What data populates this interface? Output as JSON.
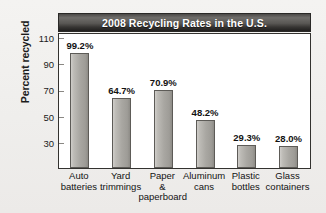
{
  "chart_data": {
    "type": "bar",
    "title": "2008 Recycling Rates in the U.S.",
    "xlabel": "",
    "ylabel": "Percent recycled",
    "categories": [
      "Auto\nbatteries",
      "Yard\ntrimmings",
      "Paper\n&\npaperboard",
      "Aluminum\ncans",
      "Plastic\nbottles",
      "Glass\ncontainers"
    ],
    "values": [
      99.2,
      64.7,
      70.9,
      48.2,
      29.3,
      28.0
    ],
    "value_labels": [
      "99.2%",
      "64.7%",
      "70.9%",
      "48.2%",
      "29.3%",
      "28.0%"
    ],
    "yticks": [
      110,
      90,
      70,
      50,
      30
    ],
    "ytick_labels": [
      "110",
      "90",
      "70",
      "50",
      "30"
    ],
    "ylim": [
      11.5,
      113
    ],
    "grid": false,
    "legend": false,
    "colors": {
      "bar_fill": "#a9a7a2",
      "bar_edge": "#5d5b57",
      "title_bar": "#403e3c",
      "title_text": "#ffffff",
      "plot_background": "#ffffff",
      "figure_background": "#f2f1ef",
      "axis": "#33322f"
    }
  }
}
